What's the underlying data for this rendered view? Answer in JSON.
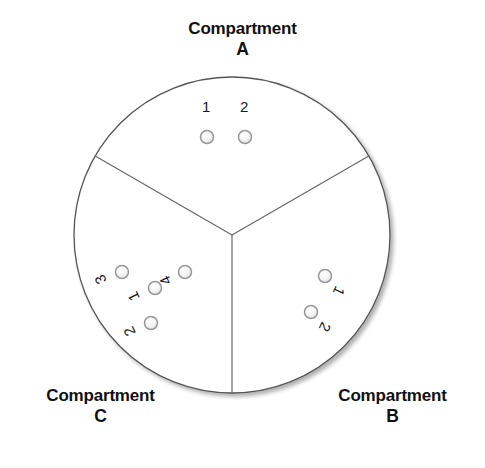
{
  "figure": {
    "type": "sector-diagram",
    "background_color": "#ffffff",
    "outline_color": "#555555",
    "divider_color": "#666666",
    "marker_fill": "#f2f2f2",
    "marker_stroke": "#999999",
    "circle": {
      "center_x": 232,
      "center_y": 235,
      "radius": 158
    },
    "dividers": [
      {
        "name": "divider-upper-left",
        "angle_deg": 210
      },
      {
        "name": "divider-upper-right",
        "angle_deg": 330
      },
      {
        "name": "divider-bottom",
        "angle_deg": 90
      }
    ]
  },
  "labels": {
    "compartment_word": "Compartment",
    "a": {
      "word": "Compartment",
      "letter": "A"
    },
    "b": {
      "word": "Compartment",
      "letter": "B"
    },
    "c": {
      "word": "Compartment",
      "letter": "C"
    }
  },
  "compartments": [
    {
      "id": "A",
      "name": "Compartment A",
      "position": "top",
      "marker_count": 2,
      "markers": [
        {
          "label": "1",
          "cx": 207,
          "cy": 137,
          "r": 6.5,
          "label_x": 202,
          "label_y": 112,
          "label_rotation": 0
        },
        {
          "label": "2",
          "cx": 245,
          "cy": 137,
          "r": 6.5,
          "label_x": 240,
          "label_y": 112,
          "label_rotation": 0
        }
      ]
    },
    {
      "id": "B",
      "name": "Compartment B",
      "position": "bottom-right",
      "marker_count": 2,
      "markers": [
        {
          "label": "1",
          "cx": 325,
          "cy": 276,
          "r": 6.5,
          "label_x": 336,
          "label_y": 285,
          "label_rotation": 115
        },
        {
          "label": "2",
          "cx": 311,
          "cy": 312,
          "r": 6.5,
          "label_x": 322,
          "label_y": 321,
          "label_rotation": 115
        }
      ]
    },
    {
      "id": "C",
      "name": "Compartment C",
      "position": "bottom-left",
      "marker_count": 4,
      "markers": [
        {
          "label": "3",
          "cx": 122,
          "cy": 272,
          "r": 6.5,
          "label_x": 107,
          "label_y": 281,
          "label_rotation": 245
        },
        {
          "label": "4",
          "cx": 185,
          "cy": 272,
          "r": 6.5,
          "label_x": 172,
          "label_y": 282,
          "label_rotation": 245
        },
        {
          "label": "1",
          "cx": 155,
          "cy": 288,
          "r": 6.5,
          "label_x": 140,
          "label_y": 298,
          "label_rotation": 245
        },
        {
          "label": "2",
          "cx": 151,
          "cy": 323,
          "r": 6.5,
          "label_x": 136,
          "label_y": 333,
          "label_rotation": 245
        }
      ]
    }
  ]
}
